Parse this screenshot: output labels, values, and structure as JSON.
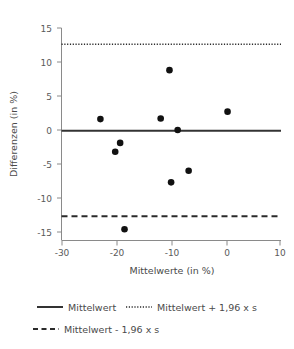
{
  "chart_data": {
    "type": "scatter",
    "title": "",
    "subtitle": "",
    "xlabel": "Mittelwerte (in %)",
    "ylabel": "Differenzen (in %)",
    "xlim": [
      -31,
      11
    ],
    "ylim": [
      -16.5,
      15.5
    ],
    "xticks": [
      -30,
      -20,
      -10,
      0,
      10
    ],
    "xtick_labels": [
      "-30",
      "-20",
      "-10",
      "0",
      "10"
    ],
    "yticks": [
      15,
      10,
      5,
      0,
      -5,
      -10,
      -15
    ],
    "ytick_labels": [
      "15",
      "10",
      "5",
      "0",
      "-5",
      "-10",
      "-15"
    ],
    "grid": false,
    "legend_position": "bottom",
    "points": [
      {
        "x": -23.1,
        "y": 1.6
      },
      {
        "x": -20.4,
        "y": -3.2
      },
      {
        "x": -19.5,
        "y": -1.9
      },
      {
        "x": -18.7,
        "y": -14.6
      },
      {
        "x": -12.1,
        "y": 1.7
      },
      {
        "x": -10.5,
        "y": 8.8
      },
      {
        "x": -10.2,
        "y": -7.7
      },
      {
        "x": -9.0,
        "y": 0.0
      },
      {
        "x": -7.0,
        "y": -6.0
      },
      {
        "x": 0.1,
        "y": 2.7
      }
    ],
    "reference_lines": [
      {
        "name": "mean",
        "label": "Mittelwert",
        "value": -0.1,
        "style": "solid"
      },
      {
        "name": "upper_loa",
        "label": "Mittelwert + 1,96 x s",
        "value": 12.6,
        "style": "dotted"
      },
      {
        "name": "lower_loa",
        "label": "Mittelwert - 1,96 x s",
        "value": -12.7,
        "style": "dashed"
      }
    ],
    "series": [
      {
        "name": "Differenzen",
        "marker": "filled-circle",
        "color": "#111111"
      }
    ],
    "colors": {
      "marker": "#111111",
      "mean_line": "#333333",
      "loa_line": "#2b2b2b",
      "axis": "#8a8a8a",
      "text": "#4a4a4a",
      "background": "#ffffff"
    }
  },
  "legend": {
    "items": [
      {
        "label": "Mittelwert",
        "style": "solid"
      },
      {
        "label": "Mittelwert + 1,96 x s",
        "style": "dotted"
      },
      {
        "label": "Mittelwert - 1,96 x s",
        "style": "dashed"
      }
    ]
  },
  "axes": {
    "x_title": "Mittelwerte (in %)",
    "y_title": "Differenzen (in %)"
  }
}
